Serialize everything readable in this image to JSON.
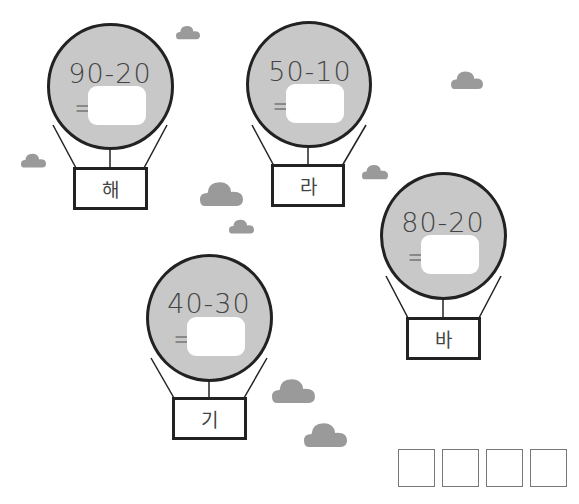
{
  "balloons": [
    {
      "id": "hae",
      "expression": "90-20",
      "equals": "=",
      "answer": "",
      "syllable": "해"
    },
    {
      "id": "ra",
      "expression": "50-10",
      "equals": "=",
      "answer": "",
      "syllable": "라"
    },
    {
      "id": "ba",
      "expression": "80-20",
      "equals": "=",
      "answer": "",
      "syllable": "바"
    },
    {
      "id": "gi",
      "expression": "40-30",
      "equals": "=",
      "answer": "",
      "syllable": "기"
    }
  ],
  "final_answer": {
    "boxes": [
      "",
      "",
      "",
      ""
    ]
  },
  "colors": {
    "envelope": "#c8c8c8",
    "cloud": "#9a9a9a",
    "outline": "#222222"
  }
}
